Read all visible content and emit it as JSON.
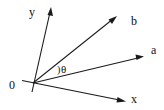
{
  "diagram": {
    "title": "",
    "origin_label": "0",
    "axes": [
      {
        "id": "y",
        "label": "y"
      },
      {
        "id": "x",
        "label": "x"
      }
    ],
    "vectors": [
      {
        "id": "b",
        "label": "b"
      },
      {
        "id": "a",
        "label": "a"
      }
    ],
    "angle": {
      "label": "θ",
      "marker": ")",
      "between": [
        "a",
        "b"
      ]
    },
    "colors": {
      "stroke": "#1a1a1a",
      "background": "#ffffff"
    }
  }
}
